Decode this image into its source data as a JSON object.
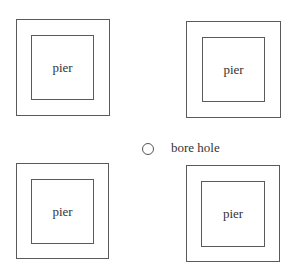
{
  "diagram": {
    "piers": [
      {
        "label": "pier",
        "position": "top-left"
      },
      {
        "label": "pier",
        "position": "top-right"
      },
      {
        "label": "pier",
        "position": "bottom-left"
      },
      {
        "label": "pier",
        "position": "bottom-right"
      }
    ],
    "bore_hole": {
      "label": "bore hole",
      "icon": "circle-icon"
    }
  }
}
